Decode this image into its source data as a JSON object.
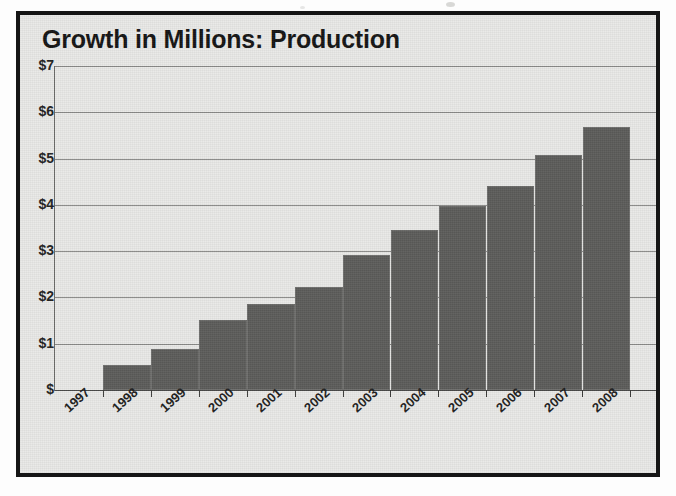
{
  "chart_data": {
    "type": "bar",
    "title": "Growth in Millions: Production",
    "xlabel": "",
    "ylabel": "",
    "categories": [
      "1997",
      "1998",
      "1999",
      "2000",
      "2001",
      "2002",
      "2003",
      "2004",
      "2005",
      "2006",
      "2007",
      "2008"
    ],
    "values": [
      0,
      0.55,
      0.88,
      1.52,
      1.85,
      2.22,
      2.92,
      3.45,
      3.98,
      4.4,
      5.08,
      5.68
    ],
    "series": [
      {
        "name": "Production",
        "values": [
          0,
          0.55,
          0.88,
          1.52,
          1.85,
          2.22,
          2.92,
          3.45,
          3.98,
          4.4,
          5.08,
          5.68
        ]
      }
    ],
    "ylim": [
      0,
      7
    ],
    "ytick_values": [
      0,
      1,
      2,
      3,
      4,
      5,
      6,
      7
    ],
    "ytick_labels": [
      "$",
      "$1",
      "$2",
      "$3",
      "$4",
      "$5",
      "$6",
      "$7"
    ],
    "grid": true,
    "legend": false,
    "legend_position": "none",
    "bar_color": "#5c5c5a",
    "plot_background": "#e9e9e7",
    "gridline_color": "#8a8a88",
    "title_color": "#141414",
    "xtick_rotation": -42
  }
}
